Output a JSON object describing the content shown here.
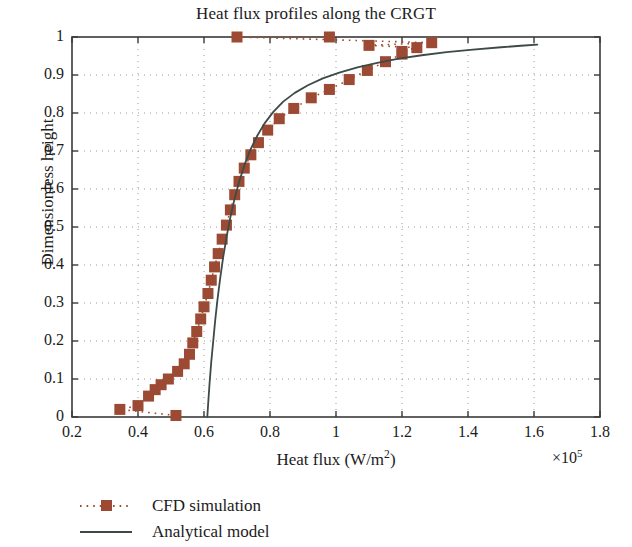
{
  "chart_data": {
    "type": "line",
    "title": "Heat flux profiles along the CRGT",
    "xlabel": "Heat flux (W/m",
    "xlabel_sup": "2",
    "xlabel_tail": ")",
    "ylabel": "Dimensionless height",
    "x_exponent_base": "×10",
    "x_exponent_power": "5",
    "xlim": [
      0.2,
      1.8
    ],
    "ylim": [
      0,
      1
    ],
    "x_scale_factor": 100000,
    "xticks": [
      0.2,
      0.4,
      0.6,
      0.8,
      1.0,
      1.2,
      1.4,
      1.6,
      1.8
    ],
    "xtick_labels": [
      "0.2",
      "0.4",
      "0.6",
      "0.8",
      "1",
      "1.2",
      "1.4",
      "1.6",
      "1.8"
    ],
    "yticks": [
      0,
      0.1,
      0.2,
      0.3,
      0.4,
      0.5,
      0.6,
      0.7,
      0.8,
      0.9,
      1.0
    ],
    "ytick_labels": [
      "0",
      "0.1",
      "0.2",
      "0.3",
      "0.4",
      "0.5",
      "0.6",
      "0.7",
      "0.8",
      "0.9",
      "1"
    ],
    "grid": true,
    "grid_style": "dotted",
    "grid_color": "#9a9a9a",
    "axis_color": "#3a3a3a",
    "legend_position": "below-left",
    "series": [
      {
        "name": "CFD simulation",
        "style": "dotted-with-square-markers",
        "color": "#9d4a34",
        "marker": "square",
        "points": [
          [
            0.345,
            0.02
          ],
          [
            0.4,
            0.03
          ],
          [
            0.432,
            0.055
          ],
          [
            0.452,
            0.072
          ],
          [
            0.47,
            0.085
          ],
          [
            0.492,
            0.1
          ],
          [
            0.515,
            0.004
          ],
          [
            0.52,
            0.12
          ],
          [
            0.54,
            0.14
          ],
          [
            0.556,
            0.165
          ],
          [
            0.566,
            0.195
          ],
          [
            0.578,
            0.225
          ],
          [
            0.59,
            0.258
          ],
          [
            0.6,
            0.29
          ],
          [
            0.612,
            0.325
          ],
          [
            0.622,
            0.36
          ],
          [
            0.632,
            0.395
          ],
          [
            0.643,
            0.43
          ],
          [
            0.655,
            0.468
          ],
          [
            0.668,
            0.505
          ],
          [
            0.68,
            0.545
          ],
          [
            0.693,
            0.585
          ],
          [
            0.706,
            0.62
          ],
          [
            0.722,
            0.655
          ],
          [
            0.742,
            0.69
          ],
          [
            0.765,
            0.722
          ],
          [
            0.793,
            0.755
          ],
          [
            0.828,
            0.785
          ],
          [
            0.872,
            0.812
          ],
          [
            0.925,
            0.84
          ],
          [
            0.98,
            0.862
          ],
          [
            1.04,
            0.888
          ],
          [
            1.095,
            0.912
          ],
          [
            1.15,
            0.935
          ],
          [
            1.2,
            0.955
          ],
          [
            1.245,
            0.972
          ],
          [
            1.29,
            0.985
          ],
          [
            0.7,
            1.0
          ],
          [
            0.98,
            1.0
          ],
          [
            1.1,
            0.978
          ],
          [
            1.2,
            0.962
          ]
        ]
      },
      {
        "name": "Analytical model",
        "style": "solid",
        "color": "#3d4a47",
        "points": [
          [
            0.61,
            0.0
          ],
          [
            0.613,
            0.04
          ],
          [
            0.617,
            0.09
          ],
          [
            0.622,
            0.145
          ],
          [
            0.628,
            0.2
          ],
          [
            0.634,
            0.255
          ],
          [
            0.641,
            0.31
          ],
          [
            0.649,
            0.365
          ],
          [
            0.658,
            0.42
          ],
          [
            0.668,
            0.472
          ],
          [
            0.679,
            0.522
          ],
          [
            0.692,
            0.572
          ],
          [
            0.706,
            0.618
          ],
          [
            0.722,
            0.662
          ],
          [
            0.74,
            0.702
          ],
          [
            0.76,
            0.738
          ],
          [
            0.783,
            0.772
          ],
          [
            0.81,
            0.803
          ],
          [
            0.84,
            0.83
          ],
          [
            0.875,
            0.853
          ],
          [
            0.915,
            0.873
          ],
          [
            0.96,
            0.891
          ],
          [
            1.01,
            0.906
          ],
          [
            1.065,
            0.92
          ],
          [
            1.125,
            0.932
          ],
          [
            1.19,
            0.943
          ],
          [
            1.26,
            0.952
          ],
          [
            1.335,
            0.96
          ],
          [
            1.415,
            0.967
          ],
          [
            1.5,
            0.973
          ],
          [
            1.56,
            0.977
          ],
          [
            1.61,
            0.98
          ]
        ]
      }
    ]
  },
  "legend": {
    "items": [
      {
        "label": "CFD simulation",
        "marker": "square",
        "line": "dotted",
        "color": "#9d4a34"
      },
      {
        "label": "Analytical model",
        "marker": "none",
        "line": "solid",
        "color": "#3d4a47"
      }
    ]
  }
}
